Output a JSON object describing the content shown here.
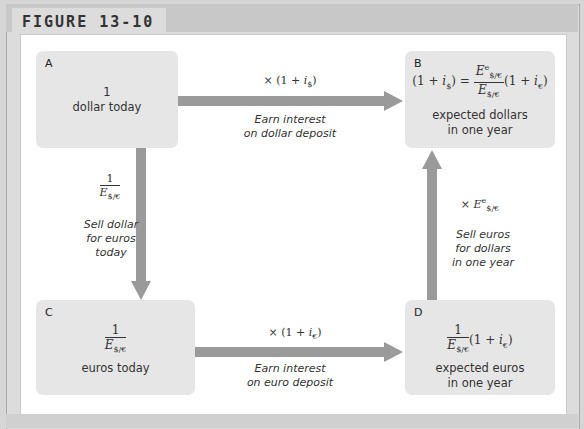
{
  "figure": {
    "label": "FIGURE 13-10"
  },
  "boxes": {
    "A": {
      "tag": "A",
      "value": "1",
      "description": "dollar today"
    },
    "B": {
      "tag": "B",
      "equation_lhs": "(1 + i$)",
      "equation_rhs": "Ee$/€ / E$/€ (1 + i€)",
      "description_line1": "expected dollars",
      "description_line2": "in one year"
    },
    "C": {
      "tag": "C",
      "value": "1 / E$/€",
      "description": "euros today"
    },
    "D": {
      "tag": "D",
      "value": "1 / E$/€ (1 + i€)",
      "description_line1": "expected euros",
      "description_line2": "in one year"
    }
  },
  "arrows": {
    "A_to_B": {
      "formula": "× (1 + i$)",
      "caption_line1": "Earn interest",
      "caption_line2": "on dollar deposit"
    },
    "A_to_C": {
      "formula": "1 / E$/€",
      "caption_line1": "Sell dollar",
      "caption_line2": "for euros",
      "caption_line3": "today"
    },
    "C_to_D": {
      "formula": "× (1 + i€)",
      "caption_line1": "Earn interest",
      "caption_line2": "on euro deposit"
    },
    "D_to_B": {
      "formula": "× Ee$/€",
      "caption_line1": "Sell euros",
      "caption_line2": "for dollars",
      "caption_line3": "in one year"
    }
  },
  "symbols": {
    "one": "1",
    "times": "×",
    "open": "(1 + ",
    "close": ")",
    "i": "i",
    "E": "E",
    "dollar_sub": "$",
    "euro_sub": "€",
    "rate_sub": "$/€",
    "e_sup": "e",
    "equals": " = "
  },
  "colors": {
    "arrow": "#9a9a9a",
    "box": "#e6e6e6",
    "header": "#c8c8c8"
  }
}
